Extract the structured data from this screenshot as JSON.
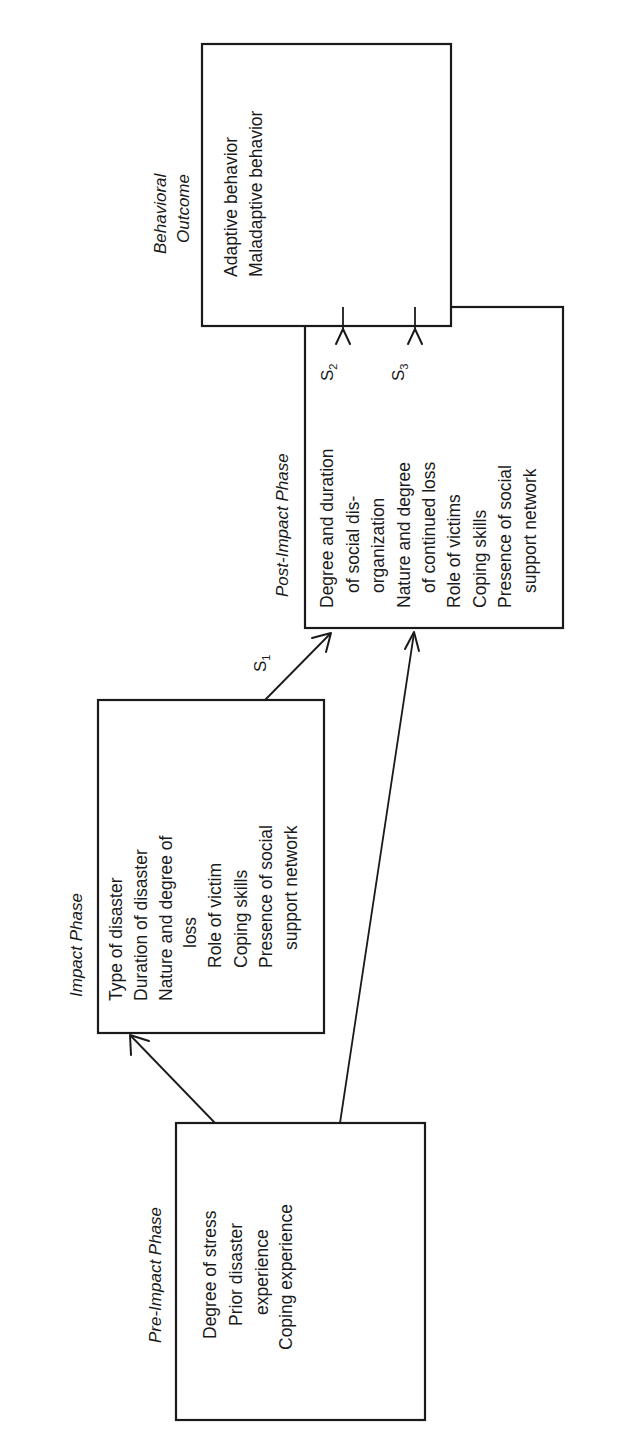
{
  "diagram": {
    "phases": [
      {
        "id": "pre-impact",
        "title": "Pre-Impact Phase",
        "lines": [
          "Degree of stress",
          "Prior disaster",
          "experience",
          "Coping experience"
        ]
      },
      {
        "id": "impact",
        "title": "Impact Phase",
        "lines": [
          "Type of disaster",
          "Duration of disaster",
          "Nature and degree of",
          "loss",
          "Role of victim",
          "Coping skills",
          "Presence of social",
          "support network"
        ]
      },
      {
        "id": "post-impact",
        "title": "Post-Impact Phase",
        "lines": [
          "Degree and duration",
          "of social dis-",
          "organization",
          "Nature and degree",
          "of continued loss",
          "Role of victims",
          "Coping skills",
          "Presence of social",
          "support network"
        ]
      },
      {
        "id": "behavioral-outcome",
        "title_line1": "Behavioral",
        "title_line2": "Outcome",
        "lines": [
          "Adaptive behavior",
          "Maladaptive behavior"
        ]
      }
    ],
    "arrows": [
      {
        "from": "pre-impact",
        "to": "impact",
        "label": ""
      },
      {
        "from": "pre-impact",
        "to": "post-impact",
        "label": ""
      },
      {
        "from": "impact",
        "to": "post-impact",
        "label": "S",
        "index": "1"
      },
      {
        "from": "post-impact",
        "to": "behavioral-outcome",
        "label": "S",
        "index": "2"
      },
      {
        "from": "post-impact",
        "to": "behavioral-outcome",
        "label": "S",
        "index": "3"
      }
    ],
    "colors": {
      "ink": "#1a1a1a",
      "paper": "#ffffff"
    }
  }
}
